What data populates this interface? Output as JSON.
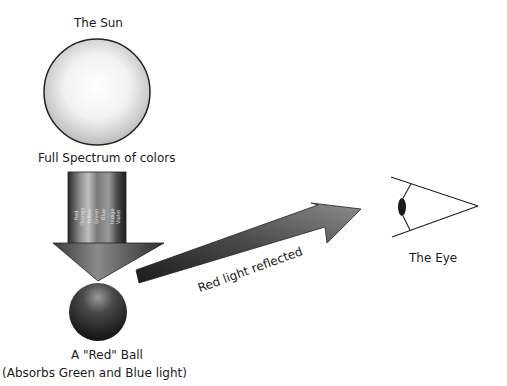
{
  "sun": {
    "label": "The Sun"
  },
  "spectrum": {
    "label": "Full Spectrum of colors",
    "colors": [
      "Red",
      "Orange",
      "Yellow",
      "Green",
      "Blue",
      "Indigo",
      "Violet"
    ]
  },
  "ball": {
    "label": "A \"Red\" Ball",
    "sublabel": "(Absorbs Green and Blue light)"
  },
  "reflection": {
    "label": "Red light reflected"
  },
  "eye": {
    "label": "The Eye"
  }
}
